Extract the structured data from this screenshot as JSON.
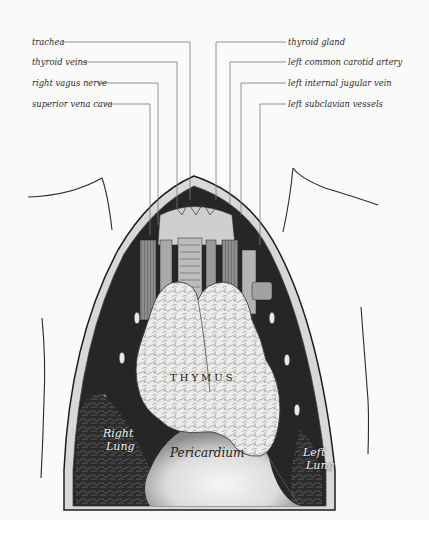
{
  "figure": {
    "type": "anatomical-illustration",
    "background_color": "#fafaf9",
    "line_color": "#7a7a7a",
    "ink_color": "#1a1a1a"
  },
  "callouts": {
    "left": [
      {
        "id": "trachea",
        "text": "trachea",
        "label_y": 42,
        "vertical_x": 190
      },
      {
        "id": "thyroid-veins",
        "text": "thyroid veins",
        "label_y": 62,
        "vertical_x": 177
      },
      {
        "id": "right-vagus-nerve",
        "text": "right vagus nerve",
        "label_y": 83,
        "vertical_x": 158
      },
      {
        "id": "superior-vena-cava",
        "text": "superior vena cava",
        "label_y": 104,
        "vertical_x": 150
      }
    ],
    "right": [
      {
        "id": "thyroid-gland",
        "text": "thyroid gland",
        "label_y": 42,
        "vertical_x": 216
      },
      {
        "id": "left-common-carotid-artery",
        "text": "left common carotid artery",
        "label_y": 62,
        "vertical_x": 230
      },
      {
        "id": "left-internal-jugular-vein",
        "text": "left internal jugular vein",
        "label_y": 83,
        "vertical_x": 241
      },
      {
        "id": "left-subclavian-vessels",
        "text": "left subclavian vessels",
        "label_y": 104,
        "vertical_x": 260
      }
    ]
  },
  "organ_labels": {
    "thymus": "THYMUS",
    "pericardium": "Pericardium",
    "right_lung_line1": "Right",
    "right_lung_line2": "Lung",
    "left_lung_line1": "Left",
    "left_lung_line2": "Lung"
  }
}
